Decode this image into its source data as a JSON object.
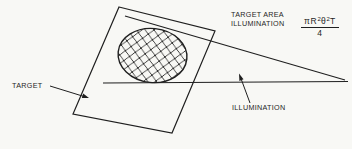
{
  "diagram": {
    "background": "#f8f8f5",
    "line_color": "#1f1f1f",
    "annotation": {
      "line1": "TARGET AREA",
      "line2": "ILLUMINATION"
    },
    "formula": {
      "pi": "π",
      "r": "R",
      "r_exponent": "2",
      "theta": "θ",
      "theta_exponent": "2",
      "t": "T",
      "denominator": "4"
    },
    "target_label": "TARGET",
    "illumination_label": "ILLUMINATION"
  }
}
